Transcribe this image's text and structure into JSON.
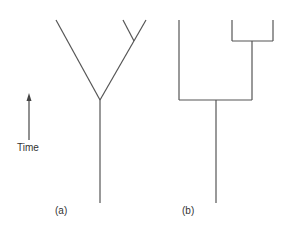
{
  "diagram": {
    "time_label": "Time",
    "panels": [
      {
        "id": "a",
        "label": "(a)",
        "style": "diagonal-branching-tree"
      },
      {
        "id": "b",
        "label": "(b)",
        "style": "rectangular-cladogram"
      }
    ],
    "colors": {
      "line": "#555555",
      "arrow_top": "#444444",
      "arrow_bottom": "#dddddd"
    }
  }
}
